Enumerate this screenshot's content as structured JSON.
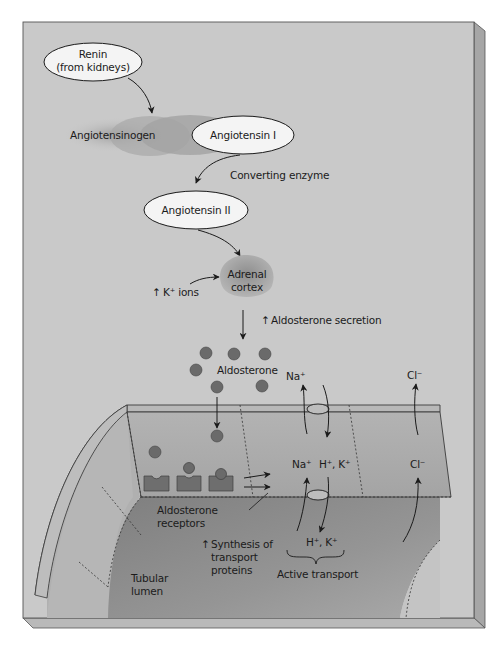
{
  "diagram": {
    "colors": {
      "panel": "#c9c9c9",
      "panel_edge": "#a8a8a8",
      "cell": "#a9a9a9",
      "cell_top": "#b8b8b8",
      "lumen": "#8d8d8d",
      "receptor": "#6e6e6e",
      "molecule": "#6a6a6a",
      "ellipse_fill": "#f4f4f4",
      "ink": "#1b1b1b"
    },
    "nodes": {
      "renin": {
        "line1": "Renin",
        "line2": "(from kidneys)"
      },
      "angiotensinogen": {
        "label": "Angiotensinogen"
      },
      "angiotensin1": {
        "label": "Angiotensin I"
      },
      "converting_enzyme": {
        "label": "Converting enzyme"
      },
      "angiotensin2": {
        "label": "Angiotensin II"
      },
      "adrenal": {
        "line1": "Adrenal",
        "line2": "cortex"
      },
      "k_ions": {
        "arrow": "↑",
        "label": "K⁺ ions"
      },
      "aldo_secretion": {
        "arrow": "↑",
        "label": "Aldosterone secretion"
      },
      "aldosterone": {
        "label": "Aldosterone"
      }
    },
    "cell": {
      "na_top": "Na⁺",
      "cl_top": "Cl⁻",
      "na_mid": "Na⁺",
      "hk_mid": "H⁺, K⁺",
      "cl_mid": "Cl⁻",
      "hk_bottom": "H⁺, K⁺",
      "active_transport": "Active transport",
      "receptors_line1": "Aldosterone",
      "receptors_line2": "receptors",
      "synthesis_arrow": "↑",
      "synthesis_line1": "Synthesis of",
      "synthesis_line2": "transport",
      "synthesis_line3": "proteins",
      "lumen_line1": "Tubular",
      "lumen_line2": "lumen"
    }
  }
}
